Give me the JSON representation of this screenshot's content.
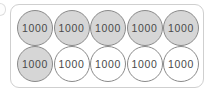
{
  "panel": {
    "name": "place-value-counter-panel",
    "border_color": "#cfcfcf",
    "background_color": "#ffffff"
  },
  "counters": {
    "value_label": "1000",
    "filled_color": "#d6d6d6",
    "empty_color": "#ffffff",
    "stroke_color": "#8a8a8a",
    "text_color": "#4a4a4a",
    "rows": [
      {
        "row_index": 1,
        "items": [
          {
            "label": "1000",
            "state": "filled"
          },
          {
            "label": "1000",
            "state": "filled"
          },
          {
            "label": "1000",
            "state": "filled"
          },
          {
            "label": "1000",
            "state": "filled"
          },
          {
            "label": "1000",
            "state": "filled"
          }
        ]
      },
      {
        "row_index": 2,
        "items": [
          {
            "label": "1000",
            "state": "filled"
          },
          {
            "label": "1000",
            "state": "empty"
          },
          {
            "label": "1000",
            "state": "empty"
          },
          {
            "label": "1000",
            "state": "empty"
          },
          {
            "label": "1000",
            "state": "empty"
          }
        ]
      }
    ]
  },
  "totals": {
    "counter_count": 10,
    "filled_count": 6,
    "empty_count": 4
  }
}
